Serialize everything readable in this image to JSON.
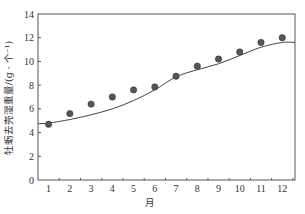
{
  "chart_data": {
    "type": "scatter",
    "title": "",
    "xlabel": "月",
    "ylabel": "牡蛎去壳湿重量/(g · 个⁻¹)",
    "x": [
      1,
      2,
      3,
      4,
      5,
      6,
      7,
      8,
      9,
      10,
      11,
      12
    ],
    "categories": [
      "1",
      "2",
      "3",
      "4",
      "5",
      "6",
      "7",
      "8",
      "9",
      "10",
      "11",
      "12"
    ],
    "series": [
      {
        "name": "observed",
        "kind": "scatter",
        "values": [
          4.7,
          5.6,
          6.4,
          7.0,
          7.6,
          7.85,
          8.75,
          9.6,
          10.2,
          10.8,
          11.6,
          12.0
        ]
      },
      {
        "name": "model",
        "kind": "line",
        "values": [
          4.8,
          5.1,
          5.5,
          6.0,
          6.7,
          7.6,
          8.7,
          9.3,
          9.8,
          10.5,
          11.2,
          11.6
        ]
      }
    ],
    "xlim": [
      0.5,
      12.6
    ],
    "ylim": [
      0,
      14
    ],
    "yticks": [
      0,
      2,
      4,
      6,
      8,
      10,
      12,
      14
    ],
    "grid": false,
    "legend": "none",
    "colors": {
      "axis": "#555555",
      "points": "#555555",
      "line": "#444444"
    }
  }
}
